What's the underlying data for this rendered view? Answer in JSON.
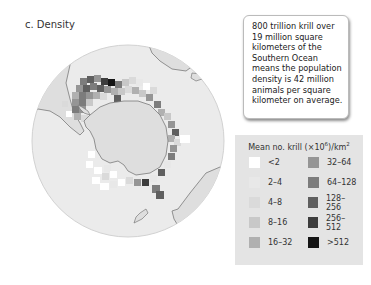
{
  "panel": {
    "title": "c. Density"
  },
  "callout": {
    "text": "800 trillion krill over 19 million square kilometers of the Southern Ocean means the population density is 42 million animals per square kilometer on average."
  },
  "legend": {
    "title_prefix": "Mean no. krill (×10",
    "title_exponent": "6",
    "title_mid": ")/km",
    "title_unit_exponent": "2",
    "items": [
      {
        "label": "<2",
        "color": "#ffffff"
      },
      {
        "label": "2–4",
        "color": "#e8e8e8"
      },
      {
        "label": "4–8",
        "color": "#dadada"
      },
      {
        "label": "8–16",
        "color": "#c8c8c8"
      },
      {
        "label": "16–32",
        "color": "#b0b0b0"
      },
      {
        "label": "32–64",
        "color": "#959595"
      },
      {
        "label": "64–128",
        "color": "#7c7c7c"
      },
      {
        "label": "128–256",
        "color": "#5f5f5f"
      },
      {
        "label": "256–512",
        "color": "#3d3d3d"
      },
      {
        "label": ">512",
        "color": "#151515"
      }
    ]
  },
  "map": {
    "projection": "south polar orthographic",
    "ocean_color": "#ebebeb",
    "land_color": "#dcdcdc",
    "coast_color": "#7a7a7a"
  }
}
